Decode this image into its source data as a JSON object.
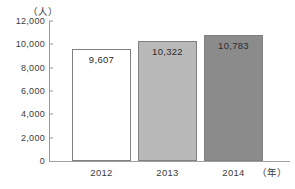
{
  "chart_data": {
    "type": "bar",
    "title": "",
    "subtitle": "",
    "xlabel": "年",
    "ylabel": "人",
    "y_unit_label": "（人）",
    "x_unit_label": "（年）",
    "categories": [
      "2012",
      "2013",
      "2014"
    ],
    "values": [
      9607,
      10322,
      10783
    ],
    "value_labels": [
      "9,607",
      "10,322",
      "10,783"
    ],
    "series": [
      {
        "name": "人数",
        "values": [
          9607,
          10322,
          10783
        ]
      }
    ],
    "ylim": [
      0,
      12000
    ],
    "y_ticks": [
      0,
      2000,
      4000,
      6000,
      8000,
      10000,
      12000
    ],
    "y_tick_labels": [
      "0",
      "2,000",
      "4,000",
      "6,000",
      "8,000",
      "10,000",
      "12,000"
    ],
    "grid": false,
    "legend": null,
    "bar_colors": [
      "#ffffff",
      "#b9b9b9",
      "#8b8b8b"
    ],
    "bar_border_color": "#808080",
    "axis_color": "#9a9a9a",
    "text_color": "#3c3c3c",
    "background": "#ffffff"
  }
}
